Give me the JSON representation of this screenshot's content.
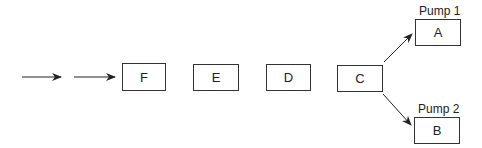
{
  "diagram": {
    "type": "flow",
    "stages": [
      {
        "id": "F",
        "label": "F"
      },
      {
        "id": "E",
        "label": "E"
      },
      {
        "id": "D",
        "label": "D"
      },
      {
        "id": "C",
        "label": "C"
      }
    ],
    "outputs": [
      {
        "id": "A",
        "label": "A",
        "caption": "Pump 1"
      },
      {
        "id": "B",
        "label": "B",
        "caption": "Pump 2"
      }
    ],
    "edges": [
      {
        "from": "input",
        "to": "input-2"
      },
      {
        "from": "input-2",
        "to": "F"
      },
      {
        "from": "C",
        "to": "A"
      },
      {
        "from": "C",
        "to": "B"
      }
    ],
    "colors": {
      "stroke": "#333333",
      "background": "#ffffff"
    }
  }
}
